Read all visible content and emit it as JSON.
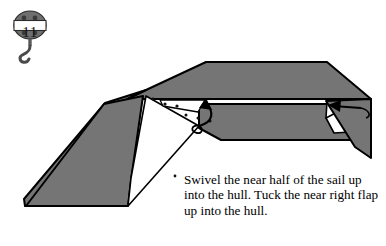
{
  "page": {
    "width": 386,
    "height": 246,
    "background": "#ffffff"
  },
  "step": {
    "number": "11",
    "badge_icon": "pulley-hook-icon",
    "badge_fill": "#6f6f6f",
    "badge_stroke": "#2b2b2b"
  },
  "caption": {
    "text": "Swivel the near half of the sail up into the hull. Tuck the near right flap up into the hull."
  },
  "diagram": {
    "name": "origami-sailboat-step-11",
    "paper_gray": "#757575",
    "paper_white": "#ffffff",
    "outline": "#000000",
    "parts": [
      {
        "name": "hull-top-deck",
        "shape": "trapezoid",
        "fill": "gray"
      },
      {
        "name": "hull-left-slope",
        "shape": "wedge",
        "fill": "gray"
      },
      {
        "name": "hull-near-side-band",
        "shape": "band",
        "fill": "gray"
      },
      {
        "name": "sail-near-half-panel",
        "shape": "parallelogram",
        "fill": "white"
      },
      {
        "name": "near-right-flap",
        "shape": "triangle",
        "fill": "gray"
      },
      {
        "name": "left-lower-wedge",
        "shape": "quadrilateral",
        "fill": "gray"
      },
      {
        "name": "notch-white-left",
        "shape": "triangle-notch",
        "fill": "white"
      },
      {
        "name": "notch-white-right",
        "shape": "triangle-notch",
        "fill": "white"
      }
    ],
    "arrows": [
      {
        "name": "swivel-sail-arrow",
        "direction": "up-into-hull",
        "style": "curved-with-loop-tail"
      },
      {
        "name": "tuck-right-flap-arrow",
        "direction": "up-left-into-hull",
        "style": "straight"
      }
    ],
    "fold_dots": 7
  }
}
